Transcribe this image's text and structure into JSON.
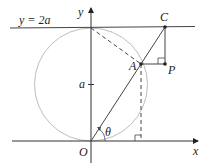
{
  "figure": {
    "labels": {
      "line_eq": "y = 2a",
      "y_axis": "y",
      "x_axis": "x",
      "origin": "O",
      "point_A": "A",
      "point_C": "C",
      "point_P": "P",
      "radius_mark": "a",
      "angle": "θ"
    },
    "colors": {
      "axis": "#333333",
      "line": "#444444",
      "circle": "#b8b8b8",
      "dashed": "#444444",
      "points": "#222222"
    }
  }
}
